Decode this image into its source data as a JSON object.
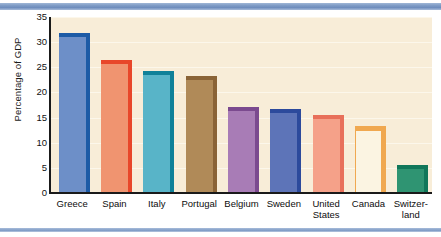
{
  "chart_data": {
    "type": "bar",
    "title": "",
    "xlabel": "",
    "ylabel": "Percentage of GDP",
    "ylim": [
      0,
      35
    ],
    "yticks": [
      0,
      5,
      10,
      15,
      20,
      25,
      30,
      35
    ],
    "ytick_labels": [
      "0",
      "5",
      "10",
      "15",
      "20",
      "25",
      "30",
      "35"
    ],
    "grid": true,
    "legend": "none",
    "categories": [
      "Greece",
      "Spain",
      "Italy",
      "Portugal",
      "Belgium",
      "Sweden",
      "United States",
      "Canada",
      "Switzerland"
    ],
    "category_label_lines": [
      [
        "Greece"
      ],
      [
        "Spain"
      ],
      [
        "Italy"
      ],
      [
        "Portugal"
      ],
      [
        "Belgium"
      ],
      [
        "Sweden"
      ],
      [
        "United",
        "States"
      ],
      [
        "Canada"
      ],
      [
        "Switzer-",
        "land"
      ]
    ],
    "values": [
      31.0,
      25.7,
      23.4,
      22.4,
      16.4,
      15.9,
      14.8,
      12.6,
      4.7
    ],
    "bar_colors": [
      "#6d8fc8",
      "#f09470",
      "#58b4c8",
      "#b08a58",
      "#a87cb6",
      "#5d74b8",
      "#f5a189",
      "#fbf4e2",
      "#2f9472"
    ],
    "bar_side_colors": [
      "#1d5ba6",
      "#e8472a",
      "#108199",
      "#8a6336",
      "#7b4a8f",
      "#2c4a9c",
      "#e8705a",
      "#f0a850",
      "#11775a"
    ],
    "plot_background": "#f8edd8",
    "gridline_color": "#fdf8ee",
    "axis_color": "#1a1a1a",
    "accent_rule_color": "#7f9cc6"
  }
}
